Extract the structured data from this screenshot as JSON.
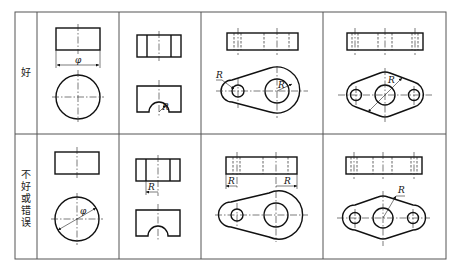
{
  "table": {
    "rows": [
      {
        "label_chars": [
          "好"
        ],
        "label": "好"
      },
      {
        "label_chars": [
          "不",
          "好",
          "或",
          "错",
          "误"
        ],
        "label": "不好或错误"
      }
    ],
    "dimension_labels": {
      "diameter": "φ",
      "radius": "R"
    }
  },
  "cells": {
    "good": [
      {
        "id": "cylinder",
        "dims": [
          "φ"
        ]
      },
      {
        "id": "half-cut-block",
        "dims": [
          "R"
        ]
      },
      {
        "id": "lever-plate",
        "dims": [
          "R",
          "R"
        ]
      },
      {
        "id": "three-hole-flange",
        "dims": [
          "R"
        ]
      }
    ],
    "bad": [
      {
        "id": "cylinder",
        "dims": [
          "φ"
        ]
      },
      {
        "id": "half-cut-block",
        "dims": [
          "R"
        ]
      },
      {
        "id": "lever-plate",
        "dims": [
          "R",
          "R"
        ]
      },
      {
        "id": "three-hole-flange",
        "dims": [
          "R"
        ]
      }
    ]
  }
}
